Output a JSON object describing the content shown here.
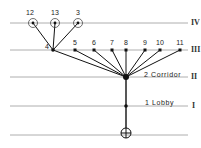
{
  "diagram": {
    "type": "circulation-tree",
    "floors": [
      {
        "y": 23,
        "roman": "IV"
      },
      {
        "y": 50,
        "roman": "III"
      },
      {
        "y": 77,
        "roman": "II",
        "label": "2  Corridor"
      },
      {
        "y": 106,
        "roman": "I",
        "label": "1  Lobby"
      },
      {
        "y": 135,
        "roman": ""
      }
    ],
    "nodes": [
      {
        "id": "12",
        "label": "12",
        "x": 33,
        "y": 23,
        "circled": true
      },
      {
        "id": "13",
        "label": "13",
        "x": 55,
        "y": 23,
        "circled": true
      },
      {
        "id": "3",
        "label": "3",
        "x": 78,
        "y": 23,
        "circled": true
      },
      {
        "id": "4",
        "label": "4",
        "x": 53,
        "y": 50
      },
      {
        "id": "5",
        "label": "5",
        "x": 75,
        "y": 50
      },
      {
        "id": "6",
        "label": "6",
        "x": 94,
        "y": 50
      },
      {
        "id": "7",
        "label": "7",
        "x": 112,
        "y": 50
      },
      {
        "id": "8",
        "label": "8",
        "x": 126,
        "y": 50
      },
      {
        "id": "9",
        "label": "9",
        "x": 145,
        "y": 50
      },
      {
        "id": "10",
        "label": "10",
        "x": 160,
        "y": 50
      },
      {
        "id": "11",
        "label": "11",
        "x": 180,
        "y": 50
      },
      {
        "id": "2",
        "label": "2",
        "x": 126,
        "y": 77,
        "hub": true
      },
      {
        "id": "1",
        "label": "1",
        "x": 126,
        "y": 106
      },
      {
        "id": "entry",
        "label": "",
        "x": 126,
        "y": 133,
        "entrance": true
      }
    ],
    "labels": {
      "n12": "12",
      "n13": "13",
      "n3": "3",
      "n4": "4",
      "n5": "5",
      "n6": "6",
      "n7": "7",
      "n8": "8",
      "n9": "9",
      "n10": "10",
      "n11": "11",
      "corridor": "2  Corridor",
      "lobby": "1  Lobby",
      "r4": "IV",
      "r3": "III",
      "r2": "II",
      "r1": "I"
    }
  }
}
